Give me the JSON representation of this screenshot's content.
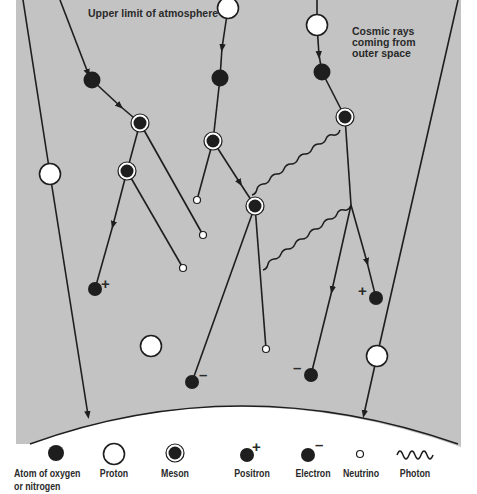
{
  "diagram": {
    "title_label": "Upper limit of atmosphere",
    "source_label_lines": [
      "Cosmic rays",
      "coming from",
      "outer space"
    ],
    "colors": {
      "atmosphere": "#c3c3c3",
      "earth": "#ffffff",
      "line": "#1e1e1e",
      "particle_dark": "#1e1e1e",
      "particle_light": "#ffffff"
    },
    "charge_signs": {
      "positive": "+",
      "negative": "–"
    }
  },
  "legend": {
    "items": [
      {
        "id": "atom",
        "icon": "filled-circle-icon",
        "label_lines": [
          "Atom of oxygen",
          "or nitrogen"
        ]
      },
      {
        "id": "proton",
        "icon": "open-circle-icon",
        "label_lines": [
          "Proton"
        ]
      },
      {
        "id": "meson",
        "icon": "ringed-circle-icon",
        "label_lines": [
          "Meson"
        ]
      },
      {
        "id": "positron",
        "icon": "positive-dot-icon",
        "label_lines": [
          "Positron"
        ]
      },
      {
        "id": "electron",
        "icon": "negative-dot-icon",
        "label_lines": [
          "Electron"
        ]
      },
      {
        "id": "neutrino",
        "icon": "small-circle-icon",
        "label_lines": [
          "Neutrino"
        ]
      },
      {
        "id": "photon",
        "icon": "wavy-line-icon",
        "label_lines": [
          "Photon"
        ]
      }
    ]
  }
}
